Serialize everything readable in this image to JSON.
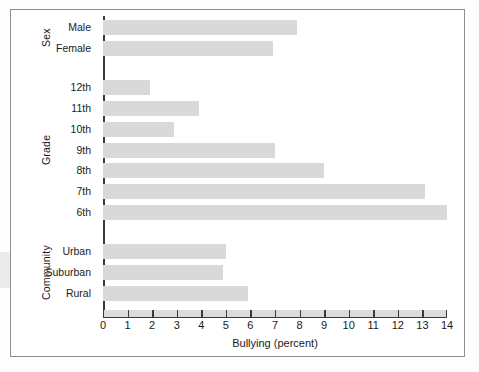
{
  "figure": {
    "background_color": "#ffffff",
    "frame_color": "#8e8e96",
    "bar_color": "#d9d9d9",
    "axis_color": "#3a3a3a",
    "axis_band_color": "#dcdcdc"
  },
  "axis": {
    "xlabel": "Bullying (percent)",
    "xticks": [
      "0",
      "1",
      "2",
      "3",
      "4",
      "5",
      "6",
      "7",
      "8",
      "9",
      "10",
      "11",
      "12",
      "13",
      "14"
    ]
  },
  "groups": [
    {
      "name": "Sex"
    },
    {
      "name": "Grade"
    },
    {
      "name": "Community"
    }
  ],
  "chart_data": {
    "type": "bar",
    "orientation": "horizontal",
    "title": "",
    "subtitle": "",
    "xlabel": "Bullying (percent)",
    "ylabel": "",
    "xlim": [
      0,
      14
    ],
    "ylim": null,
    "grid": false,
    "legend": null,
    "groups": [
      {
        "name": "Sex",
        "categories": [
          "Male",
          "Female"
        ],
        "values": [
          7.9,
          6.9
        ]
      },
      {
        "name": "Grade",
        "categories": [
          "12th",
          "11th",
          "10th",
          "9th",
          "8th",
          "7th",
          "6th"
        ],
        "values": [
          1.9,
          3.9,
          2.9,
          7.0,
          9.0,
          13.1,
          14.0
        ]
      },
      {
        "name": "Community",
        "categories": [
          "Urban",
          "Suburban",
          "Rural"
        ],
        "values": [
          5.0,
          4.9,
          5.9
        ]
      }
    ],
    "categories": [
      "Male",
      "Female",
      "12th",
      "11th",
      "10th",
      "9th",
      "8th",
      "7th",
      "6th",
      "Urban",
      "Suburban",
      "Rural"
    ],
    "values": [
      7.9,
      6.9,
      1.9,
      3.9,
      2.9,
      7.0,
      9.0,
      13.1,
      14.0,
      5.0,
      4.9,
      5.9
    ]
  }
}
